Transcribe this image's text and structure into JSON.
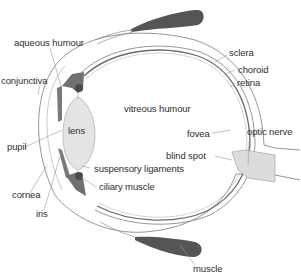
{
  "diagram": {
    "colors": {
      "background": "#ffffff",
      "outline": "#8a8a8a",
      "muscle": "#555555",
      "lens_fill": "#e4e4e4",
      "iris": "#7a7a7a",
      "ciliary": "#4a4a4a",
      "optic_nerve_fill": "#dcdcdc",
      "label_text": "#2e2e2e",
      "leader_line": "#9a9a9a"
    },
    "labels": {
      "aqueous_humour": "aqueous humour",
      "conjunctiva": "conjunctiva",
      "pupil": "pupil",
      "cornea": "cornea",
      "iris": "iris",
      "lens": "lens",
      "vitreous_humour": "vitreous humour",
      "suspensory_ligaments": "suspensory ligaments",
      "ciliary_muscle": "ciliary muscle",
      "sclera": "sclera",
      "choroid": "choroid",
      "retina": "retina",
      "fovea": "fovea",
      "optic_nerve": "optic nerve",
      "blind_spot": "blind spot",
      "muscle": "muscle"
    }
  }
}
